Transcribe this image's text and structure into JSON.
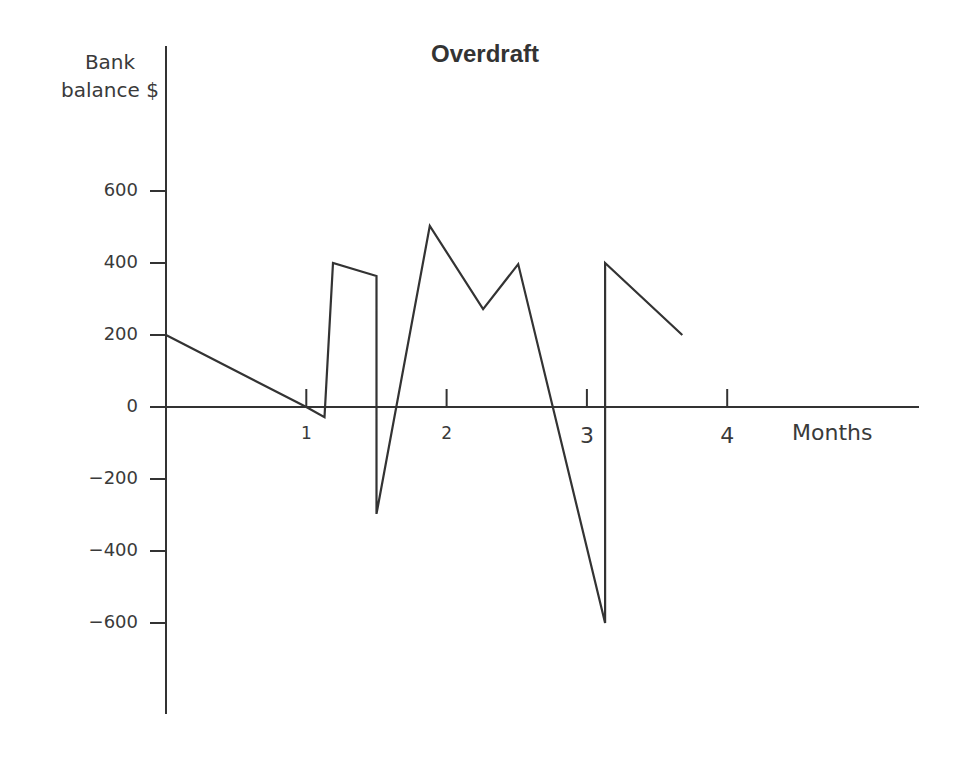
{
  "chart_data": {
    "type": "line",
    "title": "Overdraft",
    "xlabel": "Months",
    "ylabel": "Bank balance $",
    "xlim": [
      0,
      5.4
    ],
    "ylim": [
      -850,
      900
    ],
    "x_ticks": [
      1,
      2,
      3,
      4
    ],
    "x_tick_labels": [
      "1",
      "2",
      "3",
      "4"
    ],
    "y_ticks": [
      600,
      400,
      200,
      0,
      -200,
      -400,
      -600
    ],
    "y_tick_labels": [
      "600",
      "400",
      "200",
      "0",
      "−200",
      "−400",
      "−600"
    ],
    "grid": false,
    "legend": null,
    "series": [
      {
        "name": "Bank balance",
        "color": "#333333",
        "x": [
          0,
          1.0,
          1.13,
          1.19,
          1.5,
          1.5,
          1.88,
          2.26,
          2.51,
          3.13,
          3.13,
          3.68
        ],
        "values": [
          200,
          0,
          -28,
          400,
          364,
          -297,
          503,
          272,
          397,
          -600,
          400,
          200
        ]
      }
    ]
  }
}
